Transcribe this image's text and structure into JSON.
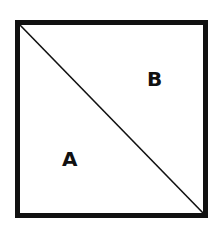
{
  "diagram": {
    "shape": "square divided by diagonal",
    "stroke_color": "#111111",
    "background": "#ffffff",
    "regions": [
      {
        "label": "A",
        "position": "lower-left triangle"
      },
      {
        "label": "B",
        "position": "upper-right triangle"
      }
    ]
  }
}
